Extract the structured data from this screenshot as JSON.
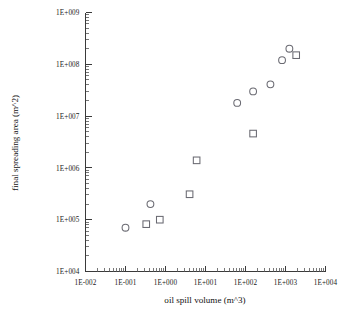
{
  "chart_data": {
    "type": "scatter",
    "title": "",
    "xlabel": "oil spill volume  (m^3)",
    "ylabel": "final spreading area  (m^2)",
    "xscale": "log",
    "yscale": "log",
    "xlim": [
      0.01,
      10000
    ],
    "ylim": [
      10000,
      1000000000
    ],
    "grid": false,
    "legend": "none",
    "xticklabels": [
      "1E-002",
      "1E-001",
      "1E+000",
      "1E+001",
      "1E+002",
      "1E+003",
      "1E+004"
    ],
    "yticklabels": [
      "1E+009",
      "1E+008",
      "1E+007",
      "1E+006",
      "1E+005",
      "1E+004"
    ],
    "xticks": [
      0.01,
      0.1,
      1,
      10,
      100,
      1000,
      10000
    ],
    "yticks": [
      1000000000,
      100000000,
      10000000,
      1000000,
      100000,
      10000
    ],
    "series": [
      {
        "name": "circles",
        "marker": "circle",
        "color": "#6a6a72",
        "points": [
          {
            "x": 0.1,
            "y": 70000
          },
          {
            "x": 0.42,
            "y": 200000
          },
          {
            "x": 62,
            "y": 18000000
          },
          {
            "x": 155,
            "y": 30000000
          },
          {
            "x": 420,
            "y": 41000000
          },
          {
            "x": 820,
            "y": 120000000
          },
          {
            "x": 1250,
            "y": 200000000
          }
        ]
      },
      {
        "name": "squares",
        "marker": "square",
        "color": "#6a6a72",
        "points": [
          {
            "x": 0.33,
            "y": 82000
          },
          {
            "x": 0.72,
            "y": 100000
          },
          {
            "x": 4.0,
            "y": 310000
          },
          {
            "x": 6.0,
            "y": 1400000
          },
          {
            "x": 155,
            "y": 4600000
          },
          {
            "x": 1850,
            "y": 150000000
          }
        ]
      }
    ]
  },
  "axes": {
    "x_title": "oil spill volume  (m^3)",
    "y_title": "final spreading area  (m^2)"
  }
}
